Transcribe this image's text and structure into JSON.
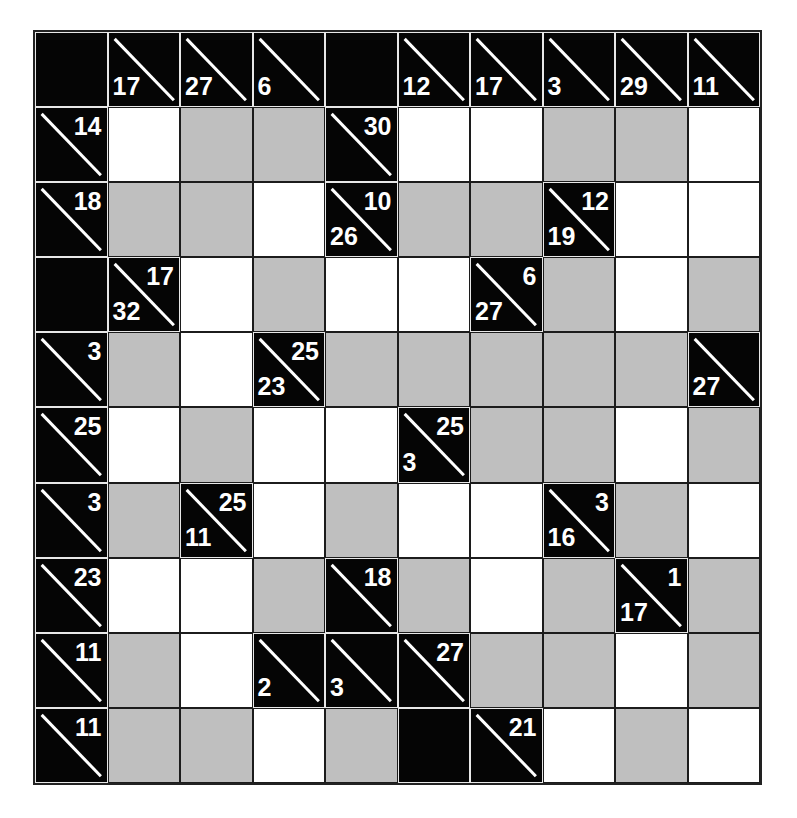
{
  "puzzle": {
    "type": "kakuro",
    "rows": 10,
    "cols": 10,
    "colors": {
      "white": "#ffffff",
      "gray": "#bfbfbf",
      "clue_bg": "#050505",
      "clue_text": "#ffffff",
      "grid_line": "#1c1c1c"
    },
    "grid": [
      [
        {
          "t": "B"
        },
        {
          "t": "C",
          "down": "17"
        },
        {
          "t": "C",
          "down": "27"
        },
        {
          "t": "C",
          "down": "6"
        },
        {
          "t": "B"
        },
        {
          "t": "C",
          "down": "12"
        },
        {
          "t": "C",
          "down": "17"
        },
        {
          "t": "C",
          "down": "3"
        },
        {
          "t": "C",
          "down": "29"
        },
        {
          "t": "C",
          "down": "11"
        }
      ],
      [
        {
          "t": "C",
          "across": "14"
        },
        {
          "t": "W"
        },
        {
          "t": "G"
        },
        {
          "t": "G"
        },
        {
          "t": "C",
          "across": "30"
        },
        {
          "t": "W"
        },
        {
          "t": "W"
        },
        {
          "t": "G"
        },
        {
          "t": "G"
        },
        {
          "t": "W"
        }
      ],
      [
        {
          "t": "C",
          "across": "18"
        },
        {
          "t": "G"
        },
        {
          "t": "G"
        },
        {
          "t": "W"
        },
        {
          "t": "C",
          "across": "10",
          "down": "26"
        },
        {
          "t": "G"
        },
        {
          "t": "G"
        },
        {
          "t": "C",
          "across": "12",
          "down": "19"
        },
        {
          "t": "W"
        },
        {
          "t": "W"
        }
      ],
      [
        {
          "t": "B"
        },
        {
          "t": "C",
          "across": "17",
          "down": "32"
        },
        {
          "t": "W"
        },
        {
          "t": "G"
        },
        {
          "t": "W"
        },
        {
          "t": "W"
        },
        {
          "t": "C",
          "across": "6",
          "down": "27"
        },
        {
          "t": "G"
        },
        {
          "t": "W"
        },
        {
          "t": "G"
        }
      ],
      [
        {
          "t": "C",
          "across": "3"
        },
        {
          "t": "G"
        },
        {
          "t": "W"
        },
        {
          "t": "C",
          "across": "25",
          "down": "23"
        },
        {
          "t": "G"
        },
        {
          "t": "G"
        },
        {
          "t": "G"
        },
        {
          "t": "G"
        },
        {
          "t": "G"
        },
        {
          "t": "C",
          "down": "27"
        }
      ],
      [
        {
          "t": "C",
          "across": "25"
        },
        {
          "t": "W"
        },
        {
          "t": "G"
        },
        {
          "t": "W"
        },
        {
          "t": "W"
        },
        {
          "t": "C",
          "across": "25",
          "down": "3"
        },
        {
          "t": "G"
        },
        {
          "t": "G"
        },
        {
          "t": "W"
        },
        {
          "t": "G"
        }
      ],
      [
        {
          "t": "C",
          "across": "3"
        },
        {
          "t": "G"
        },
        {
          "t": "C",
          "across": "25",
          "down": "11"
        },
        {
          "t": "W"
        },
        {
          "t": "G"
        },
        {
          "t": "W"
        },
        {
          "t": "W"
        },
        {
          "t": "C",
          "across": "3",
          "down": "16"
        },
        {
          "t": "G"
        },
        {
          "t": "W"
        }
      ],
      [
        {
          "t": "C",
          "across": "23"
        },
        {
          "t": "W"
        },
        {
          "t": "W"
        },
        {
          "t": "G"
        },
        {
          "t": "C",
          "across": "18"
        },
        {
          "t": "G"
        },
        {
          "t": "W"
        },
        {
          "t": "G"
        },
        {
          "t": "C",
          "across": "1",
          "down": "17"
        },
        {
          "t": "G"
        }
      ],
      [
        {
          "t": "C",
          "across": "11"
        },
        {
          "t": "G"
        },
        {
          "t": "W"
        },
        {
          "t": "C",
          "down": "2"
        },
        {
          "t": "C",
          "down": "3"
        },
        {
          "t": "C",
          "across": "27"
        },
        {
          "t": "G"
        },
        {
          "t": "G"
        },
        {
          "t": "W"
        },
        {
          "t": "G"
        }
      ],
      [
        {
          "t": "C",
          "across": "11"
        },
        {
          "t": "G"
        },
        {
          "t": "G"
        },
        {
          "t": "W"
        },
        {
          "t": "G"
        },
        {
          "t": "B"
        },
        {
          "t": "C",
          "across": "21"
        },
        {
          "t": "W"
        },
        {
          "t": "G"
        },
        {
          "t": "W"
        }
      ]
    ]
  }
}
